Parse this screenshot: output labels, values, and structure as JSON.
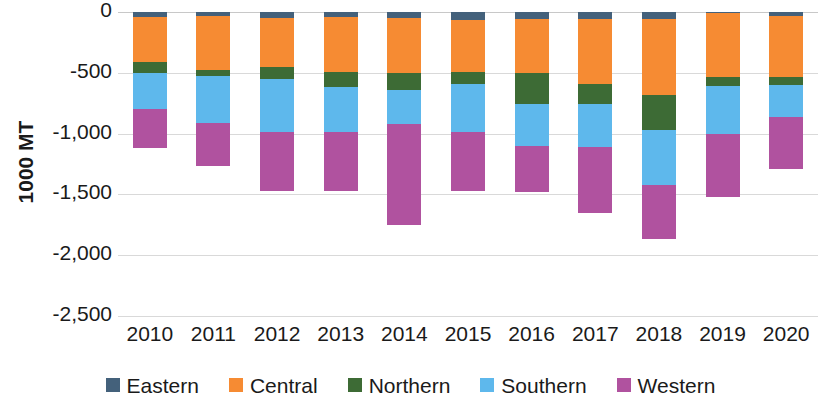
{
  "chart_data": {
    "type": "bar",
    "subtype": "stacked-column",
    "title": "",
    "xlabel": "",
    "ylabel": "1000 MT",
    "categories": [
      "2010",
      "2011",
      "2012",
      "2013",
      "2014",
      "2015",
      "2016",
      "2017",
      "2018",
      "2019",
      "2020"
    ],
    "ylim": [
      -2500,
      0
    ],
    "yticks": [
      0,
      -500,
      -1000,
      -1500,
      -2000,
      -2500
    ],
    "ytick_labels": [
      "0",
      "-500",
      "-1,000",
      "-1,500",
      "-2,000",
      "-2,500"
    ],
    "grid": true,
    "legend_position": "bottom",
    "stack_order": [
      "Eastern",
      "Central",
      "Northern",
      "Southern",
      "Western"
    ],
    "series": [
      {
        "name": "Eastern",
        "color": "#44617b",
        "values": [
          -40,
          -35,
          -50,
          -40,
          -50,
          -65,
          -55,
          -55,
          -60,
          -10,
          -35
        ]
      },
      {
        "name": "Central",
        "color": "#f68b33",
        "values": [
          -370,
          -440,
          -405,
          -450,
          -455,
          -430,
          -450,
          -540,
          -620,
          -525,
          -500
        ]
      },
      {
        "name": "Northern",
        "color": "#3d6b35",
        "values": [
          -90,
          -50,
          -100,
          -130,
          -140,
          -100,
          -250,
          -165,
          -290,
          -75,
          -65
        ]
      },
      {
        "name": "Southern",
        "color": "#5eb8ec",
        "values": [
          -300,
          -385,
          -430,
          -365,
          -275,
          -395,
          -350,
          -350,
          -450,
          -395,
          -260
        ]
      },
      {
        "name": "Western",
        "color": "#b0529f",
        "values": [
          -320,
          -360,
          -485,
          -490,
          -835,
          -485,
          -375,
          -545,
          -450,
          -520,
          -435
        ]
      }
    ],
    "totals": [
      -1120,
      -1270,
      -1470,
      -1475,
      -1755,
      -1475,
      -1480,
      -1655,
      -1870,
      -1525,
      -1295
    ]
  },
  "legend": {
    "items": [
      {
        "label": "Eastern",
        "color": "#44617b"
      },
      {
        "label": "Central",
        "color": "#f68b33"
      },
      {
        "label": "Northern",
        "color": "#3d6b35"
      },
      {
        "label": "Southern",
        "color": "#5eb8ec"
      },
      {
        "label": "Western",
        "color": "#b0529f"
      }
    ]
  },
  "axes": {
    "y_title": "1000 MT"
  },
  "style": {
    "background": "#ffffff",
    "gridline_color": "#d9d9d9",
    "text_color": "#1a1a1a"
  }
}
